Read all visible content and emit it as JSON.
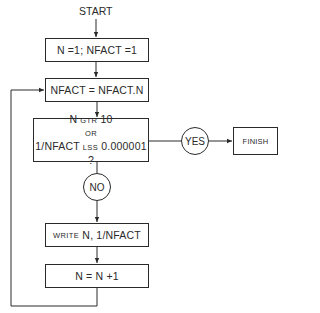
{
  "flowchart": {
    "start": "START",
    "init": "N =1;  NFACT =1",
    "compute": "NFACT = NFACT.N",
    "decision": {
      "line1_a": "N",
      "line1_op": "GTR",
      "line1_b": "10",
      "line2": "OR",
      "line3_a": "1/NFACT",
      "line3_op": "LSS",
      "line3_b": "0.000001 ?"
    },
    "yes": "YES",
    "finish": "FINISH",
    "no": "NO",
    "write": {
      "keyword": "WRITE",
      "args": "N, 1/NFACT"
    },
    "increment": "N = N +1"
  },
  "colors": {
    "line": "#2a2a2a",
    "background": "#ffffff"
  }
}
